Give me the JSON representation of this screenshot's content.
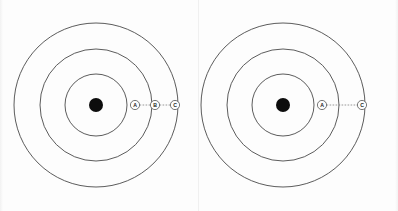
{
  "figure": {
    "background_color": "#fdfdfd",
    "ring_color": "#4a4a4a",
    "center_dot_color": "#0d0d0d",
    "marker_stroke_color": "#555555",
    "connector_color": "#7d7d7d"
  },
  "panels": [
    {
      "id": "left-panel",
      "name": "left-diagram",
      "center": {
        "x": 96,
        "y": 105
      },
      "center_dot_radius": 7,
      "rings": [
        {
          "name": "inner-ring",
          "radius": 31
        },
        {
          "name": "middle-ring",
          "radius": 56
        },
        {
          "name": "outer-ring",
          "radius": 82
        }
      ],
      "markers": [
        {
          "id": "A",
          "label": "A",
          "x": 135,
          "y": 105,
          "radius": 4.6
        },
        {
          "id": "B",
          "label": "B",
          "x": 155,
          "y": 105,
          "radius": 4.6
        },
        {
          "id": "C",
          "label": "C",
          "x": 175,
          "y": 105,
          "radius": 4.6
        }
      ],
      "connectors": [
        {
          "from": "A",
          "to": "B",
          "x1": 139.6,
          "x2": 150.4,
          "y": 105
        },
        {
          "from": "B",
          "to": "C",
          "x1": 159.6,
          "x2": 170.4,
          "y": 105
        }
      ]
    },
    {
      "id": "right-panel",
      "name": "right-diagram",
      "center": {
        "x": 84,
        "y": 105
      },
      "center_dot_radius": 7,
      "rings": [
        {
          "name": "inner-ring",
          "radius": 31
        },
        {
          "name": "middle-ring",
          "radius": 56
        },
        {
          "name": "outer-ring",
          "radius": 82
        }
      ],
      "markers": [
        {
          "id": "A",
          "label": "A",
          "x": 123,
          "y": 105,
          "radius": 4.6
        },
        {
          "id": "C",
          "label": "C",
          "x": 163,
          "y": 105,
          "radius": 4.6
        }
      ],
      "connectors": [
        {
          "from": "A",
          "to": "C",
          "x1": 127.6,
          "x2": 158.4,
          "y": 105
        }
      ]
    }
  ]
}
